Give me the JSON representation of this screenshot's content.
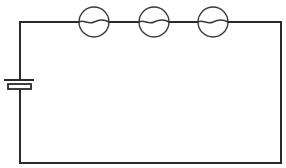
{
  "diagram": {
    "type": "series-circuit",
    "colors": {
      "background": "#ffffff",
      "wire": "#2a2a2a",
      "lamp_outline": "#3a3a3a"
    },
    "components": {
      "battery": {
        "label": "",
        "icon": "battery-cell-icon"
      },
      "lamps": [
        {
          "label": "",
          "icon": "lamp-icon"
        },
        {
          "label": "",
          "icon": "lamp-icon"
        },
        {
          "label": "",
          "icon": "lamp-icon"
        }
      ]
    }
  }
}
